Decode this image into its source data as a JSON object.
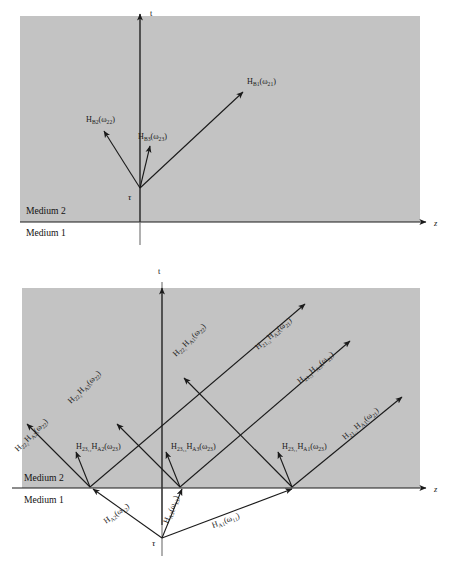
{
  "figure": {
    "type": "physics-ray-diagram",
    "panels": [
      {
        "id": "top",
        "media": {
          "upper": "Medium 2",
          "lower": "Medium 1"
        },
        "axes": {
          "x": "z",
          "y": "t"
        },
        "origin_label": "τ",
        "rays": [
          {
            "name": "ray-hb2",
            "label_main": "H",
            "label_sub1": "B2",
            "label_arg": "(ω",
            "label_sub2": "22",
            "label_close": ")"
          },
          {
            "name": "ray-hb3",
            "label_main": "H",
            "label_sub1": "B3",
            "label_arg": "(ω",
            "label_sub2": "23",
            "label_close": ")"
          },
          {
            "name": "ray-hb1",
            "label_main": "H",
            "label_sub1": "B1",
            "label_arg": "(ω",
            "label_sub2": "21",
            "label_close": ")"
          }
        ]
      },
      {
        "id": "bottom",
        "media": {
          "upper": "Medium 2",
          "lower": "Medium 1"
        },
        "axes": {
          "x": "z",
          "y": "t"
        },
        "origin_label": "τ",
        "rays_incident": [
          {
            "name": "ray-ha2",
            "text": "H_A2(ω_12)"
          },
          {
            "name": "ray-ha3",
            "text": "H_A3(ω_13)"
          },
          {
            "name": "ray-ha1",
            "text": "H_A1(ω_11)"
          }
        ],
        "rays_transmitted_left": [
          {
            "name": "ray-h222-ha2",
            "text": "H_22_2 H_A2(ω_22)"
          },
          {
            "name": "ray-h223-ha3",
            "text": "H_22_3 H_A3(ω_22)"
          },
          {
            "name": "ray-h221-ha1",
            "text": "H_22_1 H_A1(ω_22)"
          }
        ],
        "rays_transmitted_right": [
          {
            "name": "ray-h2112-ha2",
            "text": "H_21_12 H_A2(ω_21)"
          },
          {
            "name": "ray-h2113-ha3",
            "text": "H_21_13 H_A3(ω_21)"
          },
          {
            "name": "ray-h2111-ha1",
            "text": "H_21_11 H_A1(ω_21)"
          }
        ],
        "rays_vertical": [
          {
            "name": "ray-h2312-ha2",
            "text": "H_23_12 H_A2(ω_23)"
          },
          {
            "name": "ray-h2313-ha3",
            "text": "H_23_13 H_A3(ω_23)"
          },
          {
            "name": "ray-h2311-ha1",
            "text": "H_23_11 H_A1(ω_23)"
          }
        ]
      }
    ]
  },
  "text": {
    "medium2": "Medium 2",
    "medium1": "Medium 1",
    "axis_z": "z",
    "axis_t": "t",
    "tau": "τ",
    "H": "H",
    "omega": "ω",
    "paren_open": "(",
    "paren_close": ")",
    "sub_B1": "B1",
    "sub_B2": "B2",
    "sub_B3": "B3",
    "sub_21": "21",
    "sub_22": "22",
    "sub_23": "23",
    "sub_A1": "A1",
    "sub_A2": "A2",
    "sub_A3": "A3",
    "sub_11": "11",
    "sub_12": "12",
    "sub_13": "13",
    "sub_22_2": "22₂",
    "sub_22_3": "22₃",
    "sub_22_1": "22₁",
    "sub_23_12": "23₁₂",
    "sub_23_13": "23₁₃",
    "sub_23_11": "23₁₁",
    "sub_21_12": "21₁₂",
    "sub_21_13": "21₁₃",
    "sub_21_11": "21₁₁"
  },
  "colors": {
    "panel_fill": "#c3c3c3",
    "line": "#1a1a1a",
    "background": "#ffffff"
  }
}
